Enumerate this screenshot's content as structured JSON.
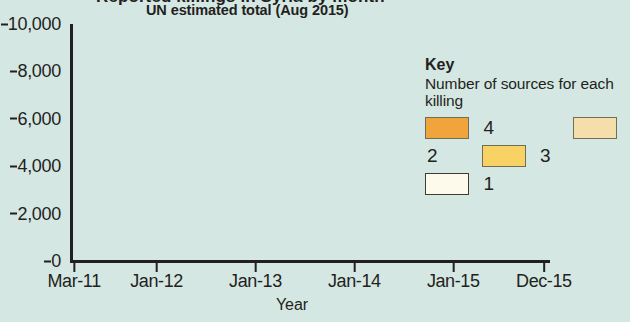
{
  "headline_cropped": "Reported killings in Syria by month",
  "chart_data": {
    "type": "bar",
    "stacked": true,
    "title": "UN estimated total (Aug 2015)",
    "xlabel": "Year",
    "ylabel": "",
    "ylim": [
      0,
      10000
    ],
    "yticks": [
      "0",
      "2,000",
      "4,000",
      "6,000",
      "8,000",
      "10,000"
    ],
    "ytick_values": [
      0,
      2000,
      4000,
      6000,
      8000,
      10000
    ],
    "xticks": [
      "Mar-11",
      "Jan-12",
      "Jan-13",
      "Jan-14",
      "Jan-15",
      "Dec-15"
    ],
    "xtick_indices": [
      0,
      10,
      22,
      34,
      46,
      57
    ],
    "grid": false,
    "legend": {
      "title": "Key",
      "subtitle": "Number of sources for each killing",
      "position": "right",
      "entries": [
        {
          "label": "4",
          "color": "#f0a43c"
        },
        {
          "label": "2",
          "color": "#f5deaa"
        },
        {
          "label": "3",
          "color": "#f8d264"
        },
        {
          "label": "1",
          "color": "#fdfaec"
        }
      ]
    },
    "categories": [
      "Mar-11",
      "Apr-11",
      "May-11",
      "Jun-11",
      "Jul-11",
      "Aug-11",
      "Sep-11",
      "Oct-11",
      "Nov-11",
      "Dec-11",
      "Jan-12",
      "Feb-12",
      "Mar-12",
      "Apr-12",
      "May-12",
      "Jun-12",
      "Jul-12",
      "Aug-12",
      "Sep-12",
      "Oct-12",
      "Nov-12",
      "Dec-12",
      "Jan-13",
      "Feb-13",
      "Mar-13",
      "Apr-13",
      "May-13",
      "Jun-13",
      "Jul-13",
      "Aug-13",
      "Sep-13",
      "Oct-13",
      "Nov-13",
      "Dec-13",
      "Jan-14",
      "Feb-14",
      "Mar-14",
      "Apr-14",
      "May-14",
      "Jun-14",
      "Jul-14",
      "Aug-14",
      "Sep-14",
      "Oct-14",
      "Nov-14",
      "Dec-14",
      "Jan-15",
      "Feb-15",
      "Mar-15",
      "Apr-15",
      "May-15",
      "Jun-15",
      "Jul-15",
      "Aug-15",
      "Sep-15",
      "Oct-15",
      "Nov-15",
      "Dec-15"
    ],
    "series": [
      {
        "name": "4",
        "color": "#f0a43c",
        "values": [
          170,
          330,
          420,
          390,
          450,
          500,
          430,
          560,
          650,
          700,
          820,
          1150,
          1450,
          1180,
          1350,
          1500,
          2050,
          2550,
          2250,
          2400,
          2350,
          2300,
          2500,
          2600,
          2450,
          2300,
          2250,
          2000,
          1950,
          2400,
          1850,
          1750,
          1900,
          1750,
          1700,
          1800,
          1700,
          1500,
          1350,
          1100,
          1500,
          1500,
          1300,
          1400,
          1250,
          1200,
          1150,
          1100,
          1250,
          1300,
          1350,
          1100,
          1200,
          1300,
          1350,
          1450,
          1500,
          1800
        ]
      },
      {
        "name": "3",
        "color": "#f6ce62",
        "values": [
          60,
          90,
          80,
          70,
          90,
          100,
          80,
          110,
          140,
          150,
          180,
          420,
          1550,
          450,
          400,
          380,
          1500,
          700,
          420,
          500,
          380,
          400,
          400,
          380,
          450,
          350,
          300,
          280,
          300,
          700,
          300,
          260,
          280,
          250,
          260,
          250,
          230,
          200,
          180,
          480,
          230,
          220,
          200,
          210,
          200,
          190,
          180,
          170,
          190,
          200,
          210,
          180,
          190,
          200,
          210,
          230,
          240,
          280
        ]
      },
      {
        "name": "2",
        "color": "#f7e3ae",
        "values": [
          80,
          110,
          100,
          90,
          110,
          130,
          100,
          140,
          170,
          190,
          230,
          480,
          750,
          520,
          470,
          450,
          900,
          620,
          500,
          560,
          450,
          480,
          480,
          450,
          520,
          420,
          380,
          340,
          360,
          500,
          350,
          320,
          340,
          300,
          310,
          300,
          280,
          250,
          220,
          350,
          280,
          270,
          250,
          260,
          240,
          230,
          220,
          210,
          230,
          240,
          250,
          220,
          230,
          240,
          250,
          270,
          290,
          320
        ]
      },
      {
        "name": "1",
        "color": "#fdf8e6",
        "values": [
          290,
          420,
          380,
          350,
          400,
          470,
          380,
          490,
          640,
          710,
          870,
          2350,
          2750,
          3750,
          4450,
          2300,
          4500,
          2100,
          1450,
          1300,
          1500,
          1200,
          1400,
          2350,
          1900,
          1500,
          1900,
          1400,
          1450,
          1600,
          1000,
          950,
          1000,
          900,
          1200,
          1250,
          900,
          800,
          700,
          600,
          800,
          780,
          650,
          1000,
          950,
          700,
          600,
          550,
          700,
          650,
          700,
          550,
          600,
          650,
          700,
          750,
          800,
          1050
        ]
      }
    ],
    "totals": [
      600,
      950,
      980,
      900,
      1050,
      1200,
      990,
      1300,
      1600,
      1750,
      2100,
      4400,
      6500,
      5900,
      6670,
      4630,
      8950,
      5970,
      4620,
      4760,
      4680,
      4380,
      4780,
      5780,
      5320,
      4570,
      4830,
      4020,
      4060,
      5200,
      3500,
      3280,
      3520,
      3200,
      3470,
      3600,
      3110,
      2750,
      2450,
      2530,
      2810,
      2770,
      2400,
      2870,
      2640,
      2320,
      2150,
      2030,
      2370,
      2390,
      2510,
      2050,
      2220,
      2390,
      2510,
      2700,
      2830,
      3450
    ]
  }
}
